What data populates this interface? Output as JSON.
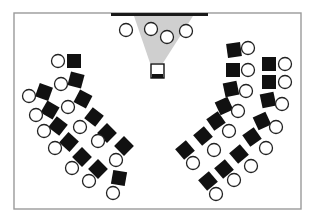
{
  "diagram": {
    "type": "classroom-seating-layout",
    "colors": {
      "background": "#ffffff",
      "room_border": "#9a9a9a",
      "board": "#1a1a1a",
      "projection_beam": "#cfcfcf",
      "seat_fill": "#111111",
      "person_stroke": "#222222",
      "person_fill": "#ffffff"
    },
    "room": {
      "x": 14,
      "y": 13,
      "width": 287,
      "height": 196
    },
    "board": {
      "x1": 111,
      "x2": 208,
      "y": 14.5,
      "thickness": 3
    },
    "projection_beam": {
      "top_left": [
        134,
        16
      ],
      "top_right": [
        193,
        16
      ],
      "bottom_right": [
        163,
        63
      ],
      "bottom_left": [
        150,
        63
      ]
    },
    "projector": {
      "x": 151,
      "y": 64,
      "width": 13,
      "height": 14,
      "base_height": 4
    },
    "front_people": [
      {
        "cx": 126,
        "cy": 30
      },
      {
        "cx": 151,
        "cy": 29
      },
      {
        "cx": 167,
        "cy": 37
      },
      {
        "cx": 186,
        "cy": 31
      }
    ],
    "left_group": {
      "seats": [
        {
          "cx": 74,
          "cy": 61,
          "rot": 0
        },
        {
          "cx": 76,
          "cy": 80,
          "rot": 15
        },
        {
          "cx": 83,
          "cy": 99,
          "rot": 28
        },
        {
          "cx": 94,
          "cy": 117,
          "rot": 38
        },
        {
          "cx": 107,
          "cy": 133,
          "rot": 45
        },
        {
          "cx": 124,
          "cy": 146,
          "rot": 45
        },
        {
          "cx": 44,
          "cy": 92,
          "rot": 20
        },
        {
          "cx": 50,
          "cy": 110,
          "rot": 30
        },
        {
          "cx": 58,
          "cy": 126,
          "rot": 38
        },
        {
          "cx": 69,
          "cy": 142,
          "rot": 42
        },
        {
          "cx": 82,
          "cy": 157,
          "rot": 45
        },
        {
          "cx": 98,
          "cy": 169,
          "rot": 45
        },
        {
          "cx": 119,
          "cy": 178,
          "rot": 10
        }
      ],
      "people": [
        {
          "cx": 58,
          "cy": 61
        },
        {
          "cx": 61,
          "cy": 84
        },
        {
          "cx": 68,
          "cy": 107
        },
        {
          "cx": 80,
          "cy": 127
        },
        {
          "cx": 98,
          "cy": 141
        },
        {
          "cx": 116,
          "cy": 160
        },
        {
          "cx": 29,
          "cy": 96
        },
        {
          "cx": 36,
          "cy": 115
        },
        {
          "cx": 44,
          "cy": 131
        },
        {
          "cx": 55,
          "cy": 148
        },
        {
          "cx": 72,
          "cy": 168
        },
        {
          "cx": 89,
          "cy": 181
        },
        {
          "cx": 113,
          "cy": 193
        }
      ]
    },
    "right_group": {
      "seats": [
        {
          "cx": 234,
          "cy": 50,
          "rot": -8
        },
        {
          "cx": 233,
          "cy": 70,
          "rot": 0
        },
        {
          "cx": 231,
          "cy": 89,
          "rot": -12
        },
        {
          "cx": 224,
          "cy": 106,
          "rot": -25
        },
        {
          "cx": 216,
          "cy": 121,
          "rot": -35
        },
        {
          "cx": 203,
          "cy": 136,
          "rot": -40
        },
        {
          "cx": 185,
          "cy": 150,
          "rot": -40
        },
        {
          "cx": 269,
          "cy": 64,
          "rot": 0
        },
        {
          "cx": 269,
          "cy": 82,
          "rot": 0
        },
        {
          "cx": 268,
          "cy": 100,
          "rot": -12
        },
        {
          "cx": 262,
          "cy": 121,
          "rot": -25
        },
        {
          "cx": 252,
          "cy": 137,
          "rot": -35
        },
        {
          "cx": 239,
          "cy": 154,
          "rot": -40
        },
        {
          "cx": 224,
          "cy": 169,
          "rot": -40
        },
        {
          "cx": 208,
          "cy": 181,
          "rot": -40
        }
      ],
      "people": [
        {
          "cx": 248,
          "cy": 48
        },
        {
          "cx": 248,
          "cy": 70
        },
        {
          "cx": 246,
          "cy": 91
        },
        {
          "cx": 238,
          "cy": 111
        },
        {
          "cx": 229,
          "cy": 131
        },
        {
          "cx": 214,
          "cy": 150
        },
        {
          "cx": 193,
          "cy": 163
        },
        {
          "cx": 285,
          "cy": 64
        },
        {
          "cx": 285,
          "cy": 82
        },
        {
          "cx": 282,
          "cy": 104
        },
        {
          "cx": 276,
          "cy": 127
        },
        {
          "cx": 266,
          "cy": 148
        },
        {
          "cx": 251,
          "cy": 166
        },
        {
          "cx": 234,
          "cy": 180
        },
        {
          "cx": 216,
          "cy": 194
        }
      ]
    },
    "seat_size": 14,
    "person_radius": 6.5
  }
}
